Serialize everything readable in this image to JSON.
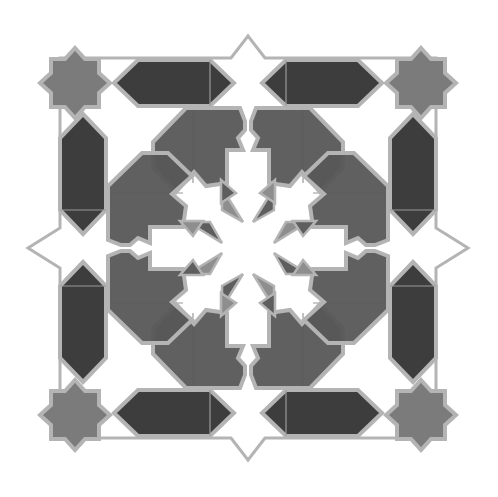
{
  "image": {
    "title": "Geometric eight-fold star tile pattern",
    "width": 498,
    "height": 497,
    "center": [
      248,
      248
    ],
    "symmetry": "8-fold (dihedral D4)"
  },
  "colors": {
    "background": "#ffffff",
    "outline": "#b4b4b4",
    "dark_fill": "#3d3d3d",
    "medium_fill": "#575757",
    "corner_star_fill": "#7b7b7b",
    "triangle_dark": "#5e5e5e",
    "triangle_light": "#8e8e8e",
    "white_fill": "#ffffff"
  },
  "elements": {
    "corner_stars": [
      {
        "name": "top-left",
        "cx": 75,
        "cy": 83
      },
      {
        "name": "top-right",
        "cx": 421,
        "cy": 83
      },
      {
        "name": "bottom-left",
        "cx": 75,
        "cy": 415
      },
      {
        "name": "bottom-right",
        "cx": 421,
        "cy": 415
      }
    ],
    "hexagon_count": 8,
    "large_segment_count": 8,
    "center_triangle_count": 16,
    "edge_star_points": 4
  }
}
